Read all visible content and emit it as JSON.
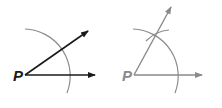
{
  "figures": [
    {
      "id": "left",
      "vertex_label": "P",
      "ray_color": "#1a1a1a",
      "arc_color": "#888888",
      "label_color": "#1a1a1a"
    },
    {
      "id": "right",
      "vertex_label": "P",
      "ray_color": "#8a8a8a",
      "arc_color": "#8a8a8a",
      "label_color": "#8a8a8a"
    }
  ]
}
